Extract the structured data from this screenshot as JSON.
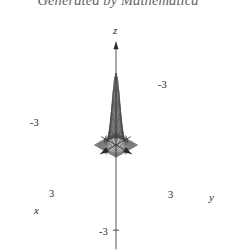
{
  "caption": {
    "text": "Generated by Mathematica"
  },
  "figure": {
    "axes": {
      "z": {
        "label": "z",
        "tick_neg": "-3"
      },
      "y": {
        "label": "y",
        "tick_pos": "3",
        "tick_neg": "-3"
      },
      "x": {
        "label": "x",
        "tick_pos": "3",
        "tick_neg": "-3"
      }
    },
    "colors": {
      "background": "#ffffff",
      "mesh": "#4a4a4a",
      "axis": "#2b2b2b",
      "caption": "#3a3a3a"
    }
  },
  "chart_data": {
    "type": "surface",
    "title": "Generated by Mathematica",
    "xlabel": "x",
    "ylabel": "y",
    "zlabel": "z",
    "xlim": [
      -3,
      3
    ],
    "ylim": [
      -3,
      3
    ],
    "zlim": [
      -3,
      3
    ],
    "xticks": [
      -3,
      3
    ],
    "yticks": [
      -3,
      3
    ],
    "zticks": [
      -3
    ],
    "grid": true,
    "legend": null,
    "mesh_divisions": 24,
    "projection": {
      "kind": "axonometric",
      "origin_px": [
        116,
        145
      ],
      "x_axis_px": [
        -3.55,
        2.02
      ],
      "y_axis_px": [
        3.55,
        2.02
      ],
      "z_axis_px": [
        0,
        -24.0
      ]
    },
    "surface": {
      "description": "radially symmetric bell-shaped peak rising from a flat square base, maximum at the origin",
      "formula": "z = 3*exp(-(x^2 + y^2)/1.1)",
      "peak_value": 3,
      "base_value": 0,
      "samples": {
        "x": [
          -3,
          -2.5,
          -2,
          -1.5,
          -1,
          -0.5,
          0,
          0.5,
          1,
          1.5,
          2,
          2.5,
          3
        ],
        "z_along_y0": [
          0.0,
          0.01,
          0.08,
          0.39,
          1.21,
          2.24,
          3.0,
          2.24,
          1.21,
          0.39,
          0.08,
          0.01,
          0.0
        ]
      }
    }
  }
}
